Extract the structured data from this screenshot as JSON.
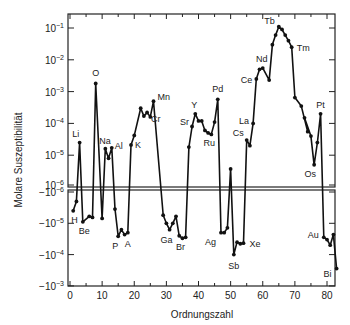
{
  "chart_data": {
    "type": "line",
    "title": "",
    "xlabel": "Ordnungszahl",
    "ylabel": "Molare Suszeptibilität",
    "xlim": [
      0,
      84
    ],
    "x_ticks": [
      0,
      10,
      20,
      30,
      40,
      50,
      60,
      70,
      80
    ],
    "y_scale": "log (split: positive upper panel, negative lower panel)",
    "upper_panel": {
      "ylim": [
        1e-06,
        0.15
      ],
      "y_ticks": [
        {
          "exp": "-1",
          "value": 0.1
        },
        {
          "exp": "-2",
          "value": 0.01
        },
        {
          "exp": "-3",
          "value": 0.001
        },
        {
          "exp": "-4",
          "value": 0.0001
        },
        {
          "exp": "-5",
          "value": 1e-05
        },
        {
          "exp": "-6",
          "value": 1e-06
        }
      ]
    },
    "lower_panel": {
      "ylim": [
        -1e-06,
        -0.001
      ],
      "y_ticks": [
        {
          "exp": "-6",
          "value": -1e-06
        },
        {
          "exp": "-5",
          "value": -1e-05
        },
        {
          "exp": "-4",
          "value": -0.0001
        },
        {
          "exp": "-3",
          "value": -0.001
        }
      ]
    },
    "grid": false,
    "legend": null,
    "series": [
      {
        "name": "Molar susceptibility vs atomic number",
        "points": [
          {
            "z": 1,
            "v": -4e-06
          },
          {
            "z": 2,
            "v": -2e-06
          },
          {
            "z": 3,
            "v": 2.5e-05
          },
          {
            "z": 4,
            "v": -9e-06
          },
          {
            "z": 6,
            "v": -6e-06
          },
          {
            "z": 7,
            "v": -6.5e-06
          },
          {
            "z": 8,
            "v": 0.0018
          },
          {
            "z": 10,
            "v": -7e-06
          },
          {
            "z": 11,
            "v": 1.6e-05
          },
          {
            "z": 12,
            "v": 1.2e-05
          },
          {
            "z": 13,
            "v": 1.7e-05
          },
          {
            "z": 14,
            "v": -3.5e-06
          },
          {
            "z": 15,
            "v": -2.6e-05
          },
          {
            "z": 16,
            "v": -1.6e-05
          },
          {
            "z": 17,
            "v": -2.3e-05
          },
          {
            "z": 18,
            "v": -2e-05
          },
          {
            "z": 19,
            "v": 2.1e-05
          },
          {
            "z": 20,
            "v": 4e-05
          },
          {
            "z": 22,
            "v": 0.00015
          },
          {
            "z": 23,
            "v": 0.0003
          },
          {
            "z": 24,
            "v": 0.00017
          },
          {
            "z": 25,
            "v": 0.00028
          },
          {
            "z": 26,
            "v": 0.00017
          },
          {
            "z": 27,
            "v": 0.0005
          }
        ],
        "segments": [
          [
            {
              "z": 1,
              "v": -4e-06,
              "label": "H"
            },
            {
              "z": 2,
              "v": -2e-06
            },
            {
              "z": 3,
              "v": 2.5e-05,
              "label": "Li"
            },
            {
              "z": 4,
              "v": -9e-06,
              "label": "Be"
            },
            {
              "z": 6,
              "v": -6e-06
            },
            {
              "z": 7,
              "v": -6.5e-06
            },
            {
              "z": 8,
              "v": 0.0018,
              "label": "O"
            },
            {
              "z": 10,
              "v": -7e-06
            },
            {
              "z": 11,
              "v": 1.6e-05,
              "label": "Na"
            },
            {
              "z": 12,
              "v": 8e-06
            },
            {
              "z": 13,
              "v": 1.7e-05,
              "label": "Al"
            },
            {
              "z": 14,
              "v": -3.5e-06
            },
            {
              "z": 15,
              "v": -2.6e-05,
              "label": "P"
            },
            {
              "z": 16,
              "v": -1.6e-05
            },
            {
              "z": 17,
              "v": -2.3e-05
            },
            {
              "z": 18,
              "v": -2e-05,
              "label": "A"
            },
            {
              "z": 19,
              "v": 2.1e-05,
              "label": "K"
            },
            {
              "z": 20,
              "v": 4.2e-05
            },
            {
              "z": 22,
              "v": 0.0003
            },
            {
              "z": 23,
              "v": 0.00017
            },
            {
              "z": 24,
              "v": 0.00022,
              "label": "Cr"
            },
            {
              "z": 25,
              "v": 0.00016
            },
            {
              "z": 26,
              "v": 0.0005,
              "label": "Mn"
            }
          ],
          [
            {
              "z": 29,
              "v": -5.5e-06
            },
            {
              "z": 30,
              "v": -1e-05
            },
            {
              "z": 31,
              "v": -1.6e-05,
              "label": "Ga"
            },
            {
              "z": 32,
              "v": -1e-05
            },
            {
              "z": 33,
              "v": -6e-06
            },
            {
              "z": 34,
              "v": -2.5e-05
            },
            {
              "z": 35,
              "v": -3e-05,
              "label": "Br"
            },
            {
              "z": 36,
              "v": -2.8e-05
            }
          ],
          [
            {
              "z": 37,
              "v": 1.8e-05
            },
            {
              "z": 38,
              "v": 8e-05,
              "label": "Sr"
            },
            {
              "z": 39,
              "v": 0.0002,
              "label": "Y"
            },
            {
              "z": 40,
              "v": 0.00012
            },
            {
              "z": 41,
              "v": 0.00012
            },
            {
              "z": 42,
              "v": 6e-05
            },
            {
              "z": 43,
              "v": 5e-05
            },
            {
              "z": 44,
              "v": 4.5e-05,
              "label": "Ru"
            },
            {
              "z": 45,
              "v": 0.00011
            },
            {
              "z": 46,
              "v": 0.00057,
              "label": "Pd"
            }
          ],
          [
            {
              "z": 47,
              "v": -2e-05,
              "label": "Ag"
            },
            {
              "z": 48,
              "v": -2e-05
            },
            {
              "z": 49,
              "v": -1.4e-05
            },
            {
              "z": 50,
              "v": 3.7e-06
            },
            {
              "z": 51,
              "v": -0.0001,
              "label": "Sb"
            },
            {
              "z": 52,
              "v": -4e-05
            },
            {
              "z": 53,
              "v": -4.5e-05
            },
            {
              "z": 54,
              "v": -4.3e-05,
              "label": "Xe"
            }
          ],
          [
            {
              "z": 55,
              "v": 3e-05,
              "label": "Cs"
            },
            {
              "z": 56,
              "v": 2e-05
            },
            {
              "z": 57,
              "v": 0.0001,
              "label": "La"
            },
            {
              "z": 58,
              "v": 0.0025,
              "label": "Ce"
            },
            {
              "z": 59,
              "v": 0.005
            },
            {
              "z": 60,
              "v": 0.0055,
              "label": "Nd"
            },
            {
              "z": 62,
              "v": 0.0023
            },
            {
              "z": 63,
              "v": 0.03
            },
            {
              "z": 64,
              "v": 0.06
            },
            {
              "z": 65,
              "v": 0.11,
              "label": "Tb"
            },
            {
              "z": 66,
              "v": 0.09
            },
            {
              "z": 67,
              "v": 0.06
            },
            {
              "z": 68,
              "v": 0.04
            },
            {
              "z": 69,
              "v": 0.025,
              "label": "Tm"
            },
            {
              "z": 70,
              "v": 0.00065
            },
            {
              "z": 72,
              "v": 0.00035
            },
            {
              "z": 74,
              "v": 5.5e-05
            },
            {
              "z": 73,
              "v": 0.00015
            },
            {
              "z": 75,
              "v": 4e-05
            },
            {
              "z": 76,
              "v": 5e-06,
              "label": "Os"
            },
            {
              "z": 77,
              "v": 2.5e-05
            },
            {
              "z": 78,
              "v": 0.0002,
              "label": "Pt"
            }
          ],
          [
            {
              "z": 79,
              "v": -2.8e-05,
              "label": "Au"
            },
            {
              "z": 80,
              "v": -3.3e-05
            },
            {
              "z": 81,
              "v": -5e-05
            },
            {
              "z": 82,
              "v": -2.3e-05
            },
            {
              "z": 83,
              "v": -0.00028,
              "label": "Bi"
            }
          ]
        ],
        "connectors": [
          {
            "from": 46,
            "to": 47
          },
          {
            "from": 36,
            "to": 37
          },
          {
            "from": 54,
            "to": 55
          },
          {
            "from": 78,
            "to": 79
          }
        ]
      }
    ],
    "element_labels": [
      "H",
      "Li",
      "Be",
      "O",
      "Na",
      "Al",
      "P",
      "A",
      "K",
      "Cr",
      "Mn",
      "Ga",
      "Br",
      "Sr",
      "Y",
      "Ru",
      "Pd",
      "Ag",
      "Sb",
      "Xe",
      "Cs",
      "La",
      "Ce",
      "Nd",
      "Tb",
      "Tm",
      "Os",
      "Pt",
      "Au",
      "Bi"
    ]
  },
  "labels": {
    "xlabel": "Ordnungszahl",
    "ylabel": "Molare Suszeptibilität",
    "x_tick_labels": [
      "0",
      "10",
      "20",
      "30",
      "40",
      "50",
      "60",
      "70",
      "80"
    ],
    "upper_tick_base": "10",
    "lower_tick_base": "−10"
  }
}
